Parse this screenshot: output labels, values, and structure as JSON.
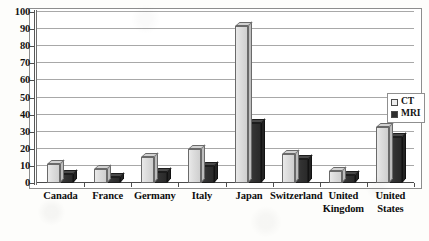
{
  "chart_data": {
    "type": "bar",
    "title": "",
    "subtitle": "",
    "xlabel": "",
    "ylabel": "",
    "ylim": [
      0,
      100
    ],
    "ytick_step": 10,
    "yticks": [
      "100",
      "90",
      "80",
      "70",
      "60",
      "50",
      "40",
      "30",
      "20",
      "10",
      "0"
    ],
    "grid": true,
    "legend_position": "right",
    "categories": [
      "Canada",
      "France",
      "Germany",
      "Italy",
      "Japan",
      "Switzerland",
      "United Kingdom",
      "United States"
    ],
    "category_lines": [
      [
        "Canada"
      ],
      [
        "France"
      ],
      [
        "Germany"
      ],
      [
        "Italy"
      ],
      [
        "Japan"
      ],
      [
        "Switzerland"
      ],
      [
        "United",
        "Kingdom"
      ],
      [
        "United",
        "States"
      ]
    ],
    "series": [
      {
        "name": "CT",
        "color": "#dcdcdc",
        "values": [
          11,
          8,
          15,
          20,
          92,
          17,
          7,
          33
        ]
      },
      {
        "name": "MRI",
        "color": "#2e2e2e",
        "values": [
          5,
          3.5,
          6.5,
          10,
          35,
          14,
          4.5,
          27
        ]
      }
    ]
  },
  "legend": {
    "items": [
      {
        "label": "CT",
        "swatch": "legend-swatch-ct"
      },
      {
        "label": "MRI",
        "swatch": "legend-swatch-mri"
      }
    ]
  }
}
